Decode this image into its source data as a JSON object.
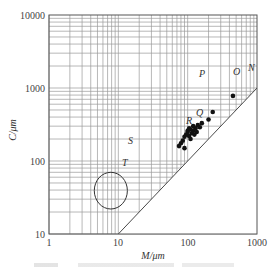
{
  "chart_data": {
    "type": "scatter",
    "title": "",
    "xlabel": "M/μm",
    "ylabel": "C/μm",
    "xscale": "log",
    "yscale": "log",
    "xlim": [
      1,
      1000
    ],
    "ylim": [
      10,
      10000
    ],
    "x_ticks": [
      "1",
      "10",
      "100",
      "1000"
    ],
    "y_ticks": [
      "10",
      "100",
      "1000",
      "10000"
    ],
    "grid": true,
    "reference_line": {
      "label": "C = M",
      "from": [
        10,
        10
      ],
      "to": [
        1000,
        1000
      ]
    },
    "region_labels": [
      {
        "label": "N",
        "x": 900,
        "y": 1400
      },
      {
        "label": "O",
        "x": 450,
        "y": 1300
      },
      {
        "label": "P",
        "x": 130,
        "y": 1150
      },
      {
        "label": "Q",
        "x": 110,
        "y": 400
      },
      {
        "label": "R",
        "x": 85,
        "y": 280
      },
      {
        "label": "S",
        "x": 30,
        "y": 200
      },
      {
        "label": "T",
        "x": 30,
        "y": 100
      }
    ],
    "ellipse": {
      "center": [
        7,
        48
      ],
      "x_range": [
        4.5,
        13.5
      ],
      "y_range": [
        22,
        70
      ]
    },
    "series": [
      {
        "name": "samples",
        "points": [
          [
            450,
            780
          ],
          [
            230,
            470
          ],
          [
            200,
            370
          ],
          [
            160,
            330
          ],
          [
            140,
            310
          ],
          [
            150,
            290
          ],
          [
            130,
            280
          ],
          [
            120,
            260
          ],
          [
            110,
            270
          ],
          [
            100,
            250
          ],
          [
            115,
            240
          ],
          [
            95,
            230
          ],
          [
            105,
            220
          ],
          [
            90,
            215
          ],
          [
            125,
            230
          ],
          [
            135,
            250
          ],
          [
            110,
            200
          ],
          [
            85,
            190
          ],
          [
            80,
            175
          ],
          [
            75,
            160
          ],
          [
            90,
            150
          ],
          [
            100,
            260
          ],
          [
            120,
            300
          ],
          [
            105,
            280
          ]
        ]
      }
    ]
  },
  "axes": {
    "xlabel": "M/μm",
    "ylabel": "C/μm",
    "x_ticks": [
      "1",
      "10",
      "100",
      "1000"
    ],
    "y_ticks": [
      "10000",
      "1000",
      "100",
      "10"
    ]
  },
  "labels": {
    "N": "N",
    "O": "O",
    "P": "P",
    "Q": "Q",
    "R": "R",
    "S": "S",
    "T": "T"
  }
}
